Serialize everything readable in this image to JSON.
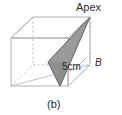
{
  "figure": {
    "caption": "(b)",
    "apex_label": "Apex",
    "edge_length_label": "5cm",
    "vertex_b_label": "B",
    "shape": "cuboid with inscribed shaded triangle",
    "colors": {
      "solid_edge": "#b0b0b0",
      "hidden_edge": "#c2c2c2",
      "triangle_fill": "#9a9a9a",
      "triangle_fill_dark": "#8a8a8a",
      "triangle_stroke": "#6e6e6e",
      "text": "#2b2b2b",
      "background": "#ffffff"
    },
    "geometry": {
      "front_top_left": [
        11,
        38
      ],
      "front_top_right": [
        68,
        38
      ],
      "front_bottom_left": [
        11,
        86
      ],
      "front_bottom_right": [
        68,
        86
      ],
      "back_top_left": [
        33,
        17
      ],
      "back_top_right": [
        90,
        17
      ],
      "back_bottom_left": [
        33,
        65
      ],
      "back_bottom_right": [
        90,
        65
      ],
      "apex_point": [
        90,
        17
      ],
      "triangle_points": [
        [
          90,
          17
        ],
        [
          48,
          62
        ],
        [
          60,
          86
        ]
      ]
    }
  }
}
